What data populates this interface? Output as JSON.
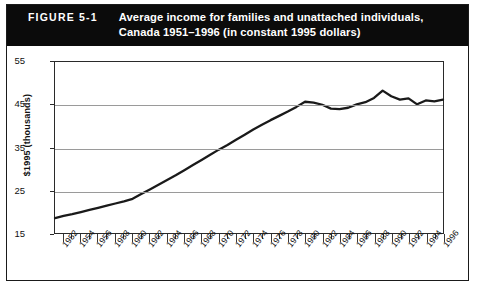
{
  "figure": {
    "number_label": "FIGURE 5-1",
    "title_line1": "Average income for families and unattached individuals,",
    "title_line2": "Canada 1951–1996 (in constant 1995 dollars)",
    "banner_bg": "#0b0b0b",
    "banner_text_color": "#ffffff"
  },
  "chart_data": {
    "type": "line",
    "title": "Average income for families and unattached individuals, Canada 1951–1996 (in constant 1995 dollars)",
    "xlabel": "",
    "ylabel": "$1995 (thousands)",
    "ylim": [
      15,
      55
    ],
    "xlim": [
      1951,
      1996
    ],
    "yticks": [
      15,
      25,
      35,
      45,
      55
    ],
    "ytick_labels": [
      "15",
      "25",
      "35",
      "45",
      "55"
    ],
    "grid": "horizontal",
    "legend": "none",
    "line_color": "#1a1a1a",
    "x": [
      1951,
      1952,
      1953,
      1954,
      1955,
      1956,
      1957,
      1958,
      1959,
      1960,
      1961,
      1962,
      1963,
      1964,
      1965,
      1966,
      1967,
      1968,
      1969,
      1970,
      1971,
      1972,
      1973,
      1974,
      1975,
      1976,
      1977,
      1978,
      1979,
      1980,
      1981,
      1982,
      1983,
      1984,
      1985,
      1986,
      1987,
      1988,
      1989,
      1990,
      1991,
      1992,
      1993,
      1994,
      1995,
      1996
    ],
    "values": [
      18.5,
      19.0,
      19.4,
      19.9,
      20.4,
      20.9,
      21.4,
      21.9,
      22.4,
      23.0,
      24.1,
      25.2,
      26.3,
      27.4,
      28.5,
      29.7,
      30.9,
      32.1,
      33.3,
      34.5,
      35.6,
      36.8,
      38.0,
      39.2,
      40.3,
      41.4,
      42.4,
      43.4,
      44.5,
      45.7,
      45.5,
      45.0,
      44.1,
      44.0,
      44.3,
      45.1,
      45.6,
      46.6,
      48.3,
      47.0,
      46.2,
      46.5,
      45.1,
      46.0,
      45.8,
      46.2
    ],
    "xtick_labels": [
      "1952",
      "1954",
      "1956",
      "1958",
      "1960",
      "1962",
      "1964",
      "1966",
      "1968",
      "1970",
      "1972",
      "1974",
      "1976",
      "1978",
      "1980",
      "1982",
      "1984",
      "1986",
      "1988",
      "1990",
      "1992",
      "1994",
      "1996"
    ],
    "xtick_values": [
      1952,
      1954,
      1956,
      1958,
      1960,
      1962,
      1964,
      1966,
      1968,
      1970,
      1972,
      1974,
      1976,
      1978,
      1980,
      1982,
      1984,
      1986,
      1988,
      1990,
      1992,
      1994,
      1996
    ]
  }
}
